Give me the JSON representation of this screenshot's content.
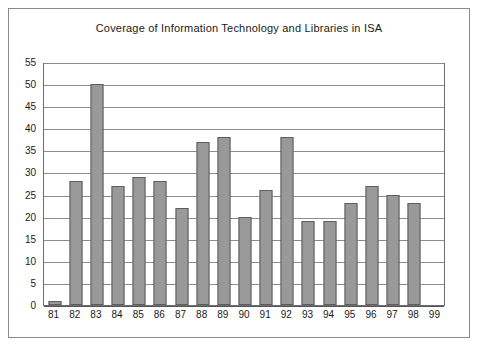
{
  "chart_data": {
    "type": "bar",
    "title": "Coverage of Information Technology and Libraries in ISA",
    "xlabel": "",
    "ylabel": "",
    "categories": [
      "81",
      "82",
      "83",
      "84",
      "85",
      "86",
      "87",
      "88",
      "89",
      "90",
      "91",
      "92",
      "93",
      "94",
      "95",
      "96",
      "97",
      "98",
      "99"
    ],
    "values": [
      1,
      28,
      50,
      27,
      29,
      28,
      22,
      37,
      38,
      20,
      26,
      38,
      19,
      19,
      23,
      27,
      25,
      23,
      0
    ],
    "ylim": [
      0,
      55
    ],
    "ytick_step": 5,
    "yticks": [
      "0",
      "5",
      "10",
      "15",
      "20",
      "25",
      "30",
      "35",
      "40",
      "45",
      "50",
      "55"
    ],
    "grid": true,
    "legend": false,
    "colors": {
      "bar_fill": "#999999",
      "bar_border": "#5d5d5d",
      "gridline": "#8d8d8d",
      "axis": "#6e6e6e",
      "frame": "#8a8a8a",
      "text": "#1a1a1a",
      "background": "#ffffff"
    }
  }
}
